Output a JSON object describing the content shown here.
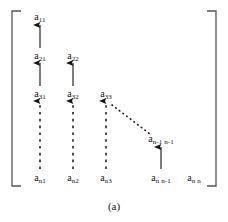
{
  "figure": {
    "caption": "(a)",
    "background": "#ffffff",
    "ink_color": "#141414",
    "bracket": {
      "left_x": 12,
      "right_x": 216,
      "top_y": 11,
      "bottom_y": 186,
      "tick": 9,
      "stroke": "#555555"
    },
    "entries": [
      {
        "id": "a11",
        "base": "a",
        "sub": "11",
        "x": 40,
        "y": 12
      },
      {
        "id": "a21",
        "base": "a",
        "sub": "21",
        "x": 40,
        "y": 51
      },
      {
        "id": "a22",
        "base": "a",
        "sub": "22",
        "x": 73,
        "y": 51
      },
      {
        "id": "a31",
        "base": "a",
        "sub": "31",
        "x": 40,
        "y": 89
      },
      {
        "id": "a32",
        "base": "a",
        "sub": "32",
        "x": 73,
        "y": 89
      },
      {
        "id": "a33",
        "base": "a",
        "sub": "33",
        "x": 106,
        "y": 89
      },
      {
        "id": "an1n1",
        "base": "a",
        "sub": "n-1 n-1",
        "x": 161,
        "y": 134
      },
      {
        "id": "an1",
        "base": "a",
        "sub": "n1",
        "x": 40,
        "y": 173
      },
      {
        "id": "an2",
        "base": "a",
        "sub": "n2",
        "x": 73,
        "y": 173
      },
      {
        "id": "an3",
        "base": "a",
        "sub": "n3",
        "x": 106,
        "y": 173
      },
      {
        "id": "annm1",
        "base": "a",
        "sub": "n n-1",
        "x": 161,
        "y": 173
      },
      {
        "id": "ann",
        "base": "a",
        "sub": "n n",
        "x": 194,
        "y": 173
      }
    ],
    "arrows": [
      {
        "id": "arrow-a21-to-a11",
        "style": "solid",
        "x1": 40,
        "y1": 48,
        "x2": 40,
        "y2": 25
      },
      {
        "id": "arrow-a31-to-a21",
        "style": "solid",
        "x1": 40,
        "y1": 86,
        "x2": 40,
        "y2": 63
      },
      {
        "id": "arrow-a32-to-a22",
        "style": "solid",
        "x1": 73,
        "y1": 86,
        "x2": 73,
        "y2": 63
      },
      {
        "id": "arrow-an1-to-a31",
        "style": "dashed",
        "x1": 40,
        "y1": 169,
        "x2": 40,
        "y2": 101
      },
      {
        "id": "arrow-an2-to-a32",
        "style": "dashed",
        "x1": 73,
        "y1": 169,
        "x2": 73,
        "y2": 101
      },
      {
        "id": "arrow-an3-to-a33",
        "style": "dashed",
        "x1": 106,
        "y1": 169,
        "x2": 106,
        "y2": 101
      },
      {
        "id": "arrow-annm1-to-an1n1",
        "style": "solid",
        "x1": 161,
        "y1": 169,
        "x2": 161,
        "y2": 147
      }
    ],
    "diagonal": {
      "id": "dotted-diagonal-a33-to-an1n1",
      "style": "dotted",
      "x1": 112,
      "y1": 105,
      "x2": 150,
      "y2": 134
    }
  }
}
